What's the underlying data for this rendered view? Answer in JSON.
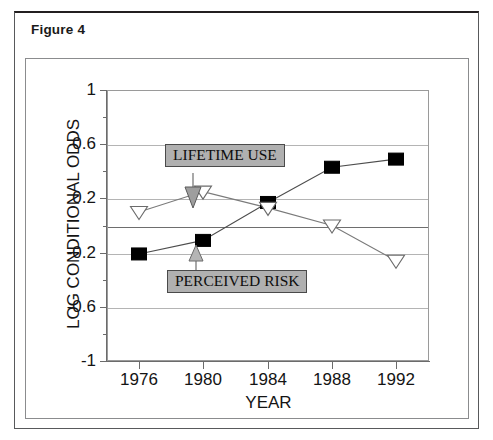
{
  "figure": {
    "title": "Figure 4"
  },
  "chart_data": {
    "type": "line",
    "title": "",
    "xlabel": "YEAR",
    "ylabel": "LOG CONDITIONAL ODDS",
    "x": [
      1976,
      1980,
      1984,
      1988,
      1992
    ],
    "xtick_labels": [
      "1976",
      "1980",
      "1984",
      "1988",
      "1992"
    ],
    "xlim": [
      1974,
      1994
    ],
    "ylim": [
      -1,
      1
    ],
    "ytick_labels": [
      "1",
      "0.6",
      "0.2",
      "-0.2",
      "-0.6",
      "-1"
    ],
    "ytick_values": [
      1,
      0.6,
      0.2,
      -0.2,
      -0.6,
      -1
    ],
    "gridlines": [
      0.6,
      0.2,
      0,
      -0.2,
      -0.6
    ],
    "grid": true,
    "legend_position": "annotations-inline",
    "series": [
      {
        "name": "PERCEIVED RISK",
        "marker": "filled-square",
        "color": "#000000",
        "values": [
          -0.21,
          -0.11,
          0.17,
          0.43,
          0.49
        ]
      },
      {
        "name": "LIFETIME USE",
        "marker": "open-triangle-down",
        "color": "#ffffff",
        "values": [
          0.1,
          0.25,
          0.13,
          0.0,
          -0.26
        ]
      }
    ],
    "annotations": [
      {
        "id": "lifetime-use",
        "text": "LIFETIME USE",
        "arrow_direction": "down",
        "points_to_series": "LIFETIME USE"
      },
      {
        "id": "perceived-risk",
        "text": "PERCEIVED RISK",
        "arrow_direction": "up",
        "points_to_series": "PERCEIVED RISK"
      }
    ]
  },
  "colors": {
    "grid": "#b4b4b4",
    "axis": "#6b6b6b",
    "callout_fill": "#b0b0b0",
    "callout_border": "#4a4a4a",
    "frame": "#8b8c8e"
  }
}
